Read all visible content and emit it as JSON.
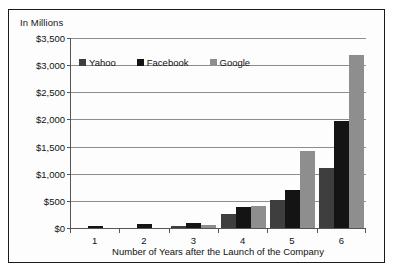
{
  "figure": {
    "unit_label": "In Millions"
  },
  "chart_data": {
    "type": "bar",
    "title": "",
    "xlabel": "Number of Years after the Launch of the Company",
    "ylabel": "In Millions",
    "ylim": [
      0,
      3500
    ],
    "ytick_labels": [
      "$3,500",
      "$3,000",
      "$2,500",
      "$2,000",
      "$1,500",
      "$1,000",
      "$500",
      "$0"
    ],
    "ytick_values": [
      3500,
      3000,
      2500,
      2000,
      1500,
      1000,
      500,
      0
    ],
    "grid": true,
    "legend_position": "inside-top-left",
    "categories": [
      "1",
      "2",
      "3",
      "4",
      "5",
      "6"
    ],
    "series": [
      {
        "name": "Yahoo",
        "color": "#3e3e3e",
        "values": [
          0,
          0,
          30,
          250,
          510,
          1100
        ]
      },
      {
        "name": "Facebook",
        "color": "#141414",
        "values": [
          35,
          80,
          100,
          380,
          700,
          1980
        ]
      },
      {
        "name": "Google",
        "color": "#8e8e8e",
        "values": [
          0,
          0,
          50,
          410,
          1420,
          3180
        ]
      }
    ]
  }
}
